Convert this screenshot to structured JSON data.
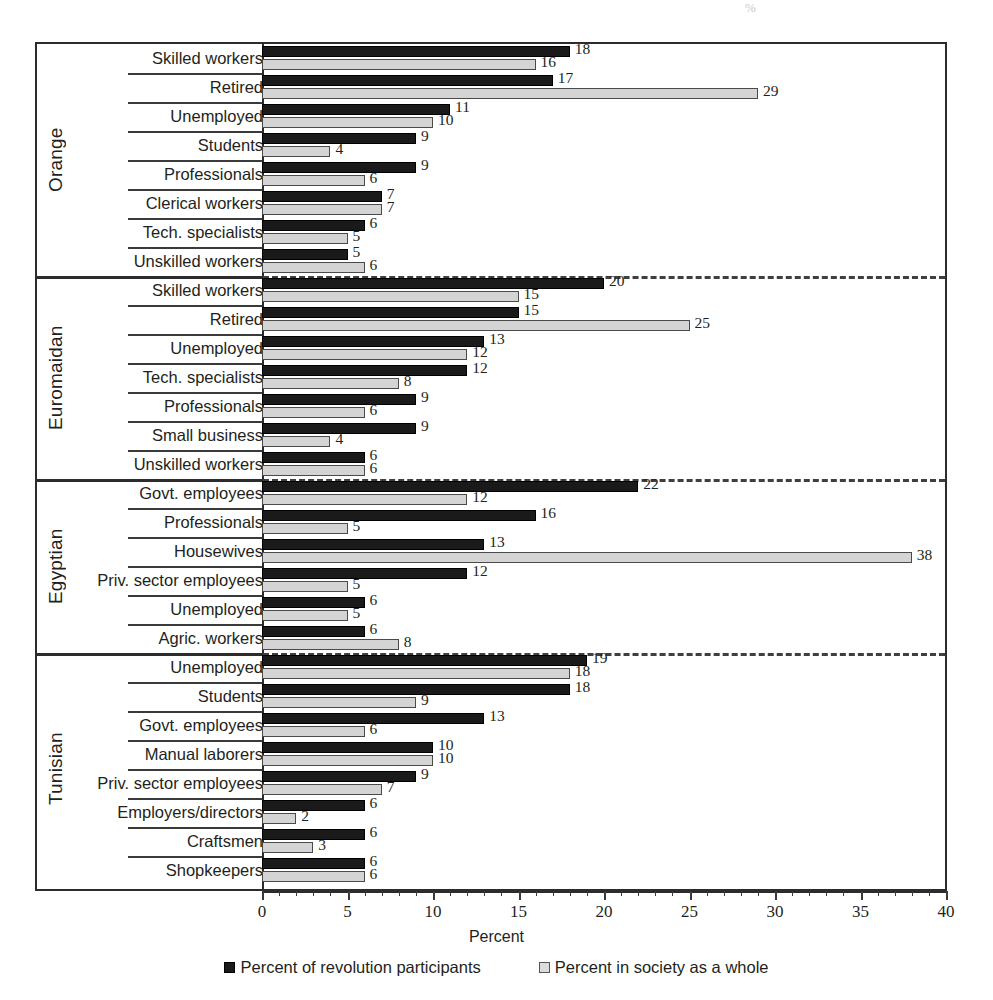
{
  "chart_data": {
    "type": "bar",
    "orientation": "horizontal",
    "title": "",
    "xlabel": "Percent",
    "ylabel": "",
    "xlim": [
      0,
      40
    ],
    "xticks": [
      0,
      5,
      10,
      15,
      20,
      25,
      30,
      35,
      40
    ],
    "xtick_labels": [
      "0",
      "5",
      "10",
      "15",
      "20",
      "25",
      "30",
      "35",
      "40"
    ],
    "minor_tick_step": 1,
    "grid": false,
    "legend_position": "bottom",
    "series": [
      {
        "name": "Percent of revolution participants",
        "key": "participants",
        "color": "#1a1a1a"
      },
      {
        "name": "Percent in society as a whole",
        "key": "society",
        "color": "#d4d4d4"
      }
    ],
    "groups": [
      {
        "name": "Orange",
        "categories": [
          {
            "label": "Skilled workers",
            "participants": 18,
            "society": 16
          },
          {
            "label": "Retired",
            "participants": 17,
            "society": 29
          },
          {
            "label": "Unemployed",
            "participants": 11,
            "society": 10
          },
          {
            "label": "Students",
            "participants": 9,
            "society": 4
          },
          {
            "label": "Professionals",
            "participants": 9,
            "society": 6
          },
          {
            "label": "Clerical workers",
            "participants": 7,
            "society": 7
          },
          {
            "label": "Tech. specialists",
            "participants": 6,
            "society": 5
          },
          {
            "label": "Unskilled workers",
            "participants": 5,
            "society": 6
          }
        ]
      },
      {
        "name": "Euromaidan",
        "categories": [
          {
            "label": "Skilled workers",
            "participants": 20,
            "society": 15
          },
          {
            "label": "Retired",
            "participants": 15,
            "society": 25
          },
          {
            "label": "Unemployed",
            "participants": 13,
            "society": 12
          },
          {
            "label": "Tech. specialists",
            "participants": 12,
            "society": 8
          },
          {
            "label": "Professionals",
            "participants": 9,
            "society": 6
          },
          {
            "label": "Small business",
            "participants": 9,
            "society": 4
          },
          {
            "label": "Unskilled workers",
            "participants": 6,
            "society": 6
          }
        ]
      },
      {
        "name": "Egyptian",
        "categories": [
          {
            "label": "Govt. employees",
            "participants": 22,
            "society": 12
          },
          {
            "label": "Professionals",
            "participants": 16,
            "society": 5
          },
          {
            "label": "Housewives",
            "participants": 13,
            "society": 38
          },
          {
            "label": "Priv. sector employees",
            "participants": 12,
            "society": 5
          },
          {
            "label": "Unemployed",
            "participants": 6,
            "society": 5
          },
          {
            "label": "Agric. workers",
            "participants": 6,
            "society": 8
          }
        ]
      },
      {
        "name": "Tunisian",
        "categories": [
          {
            "label": "Unemployed",
            "participants": 19,
            "society": 18
          },
          {
            "label": "Students",
            "participants": 18,
            "society": 9
          },
          {
            "label": "Govt. employees",
            "participants": 13,
            "society": 6
          },
          {
            "label": "Manual laborers",
            "participants": 10,
            "society": 10
          },
          {
            "label": "Priv. sector employees",
            "participants": 9,
            "society": 7
          },
          {
            "label": "Employers/directors",
            "participants": 6,
            "society": 2
          },
          {
            "label": "Craftsmen",
            "participants": 6,
            "society": 3
          },
          {
            "label": "Shopkeepers",
            "participants": 6,
            "society": 6
          }
        ]
      }
    ]
  },
  "legend": {
    "items": [
      {
        "label": "Percent of revolution participants",
        "swatch": "participants"
      },
      {
        "label": "Percent in society as a whole",
        "swatch": "society"
      }
    ]
  },
  "axis": {
    "x_title": "Percent"
  },
  "artifact": {
    "smudge": "%"
  }
}
